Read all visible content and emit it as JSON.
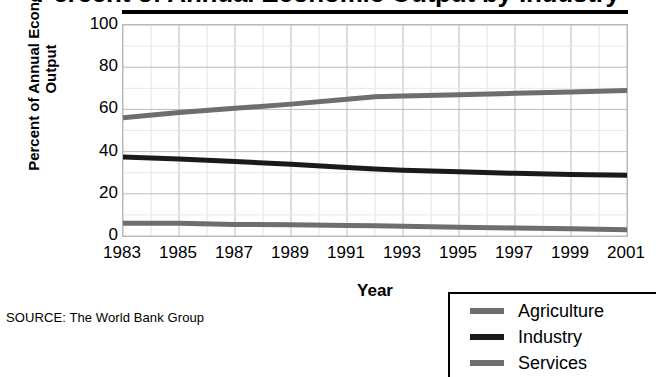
{
  "chart_data": {
    "type": "line",
    "title": "Percent of Annual Economic Output by Industry",
    "xlabel": "Year",
    "ylabel": "Percent of Annual Economic Output",
    "source": "SOURCE: The World Bank Group",
    "grid": true,
    "legend_position": "bottom-right",
    "xlim": [
      1983,
      2001
    ],
    "ylim": [
      0,
      100
    ],
    "yticks": [
      100,
      80,
      60,
      40,
      20,
      0
    ],
    "xticks": [
      1983,
      1985,
      1987,
      1989,
      1991,
      1993,
      1995,
      1997,
      1999,
      2001
    ],
    "x": [
      1983,
      1985,
      1987,
      1989,
      1991,
      1992,
      1993,
      1995,
      1997,
      1999,
      2001
    ],
    "series": [
      {
        "name": "Agriculture",
        "color": "#6e6e6e",
        "values": [
          6,
          6,
          5.5,
          5.3,
          5,
          4.8,
          4.6,
          4.2,
          3.8,
          3.4,
          3
        ]
      },
      {
        "name": "Industry",
        "color": "#1a1a1a",
        "values": [
          37.5,
          36.5,
          35.3,
          34,
          32.5,
          31.8,
          31.2,
          30.4,
          29.7,
          29.2,
          28.8
        ]
      },
      {
        "name": "Services",
        "color": "#6e6e6e",
        "values": [
          56,
          58.5,
          60.5,
          62.5,
          64.8,
          66,
          66.3,
          67,
          67.6,
          68.3,
          69
        ]
      }
    ]
  },
  "legend": {
    "items": [
      {
        "label": "Agriculture",
        "color": "#6e6e6e"
      },
      {
        "label": "Industry",
        "color": "#1a1a1a"
      },
      {
        "label": "Services",
        "color": "#6e6e6e"
      }
    ]
  }
}
